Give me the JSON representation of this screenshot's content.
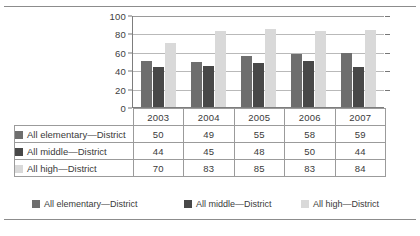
{
  "chart_data": {
    "type": "bar",
    "title": "",
    "subtitle": "",
    "xlabel": "",
    "ylabel": "",
    "categories": [
      "2003",
      "2004",
      "2005",
      "2006",
      "2007"
    ],
    "series": [
      {
        "name": "All elementary—District",
        "values": [
          50,
          49,
          55,
          58,
          59
        ],
        "color": "#6e6e6e"
      },
      {
        "name": "All middle—District",
        "values": [
          44,
          45,
          48,
          50,
          44
        ],
        "color": "#484848"
      },
      {
        "name": "All high—District",
        "values": [
          70,
          83,
          85,
          83,
          84
        ],
        "color": "#d9d9d9"
      }
    ],
    "ylim": [
      0,
      100
    ],
    "yticks": [
      0,
      20,
      40,
      60,
      80,
      100
    ],
    "ytick_labels": [
      "0",
      "20",
      "40",
      "60",
      "80",
      "100"
    ],
    "grid": true,
    "legend_position": "bottom",
    "data_table": true
  },
  "table": {
    "column_headers": [
      "",
      "2003",
      "2004",
      "2005",
      "2006",
      "2007"
    ],
    "rows": [
      {
        "label": "All elementary—District",
        "values": [
          "50",
          "49",
          "55",
          "58",
          "59"
        ]
      },
      {
        "label": "All middle—District",
        "values": [
          "44",
          "45",
          "48",
          "50",
          "44"
        ]
      },
      {
        "label": "All high—District",
        "values": [
          "70",
          "83",
          "85",
          "83",
          "84"
        ]
      }
    ]
  },
  "legend": {
    "items": [
      {
        "label": "All elementary—District"
      },
      {
        "label": "All middle—District"
      },
      {
        "label": "All high—District"
      }
    ]
  },
  "colors": {
    "elementary": "#6e6e6e",
    "middle": "#484848",
    "high": "#d9d9d9",
    "gridline": "#b9b9b9",
    "axis": "#7d7d7d",
    "border": "#9b9b9b",
    "rule": "#8c8c8c"
  }
}
